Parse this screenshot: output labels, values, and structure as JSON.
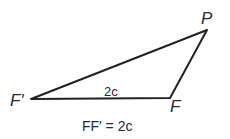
{
  "diagram": {
    "type": "triangle",
    "vertices": [
      {
        "label": "F′",
        "x": 31,
        "y": 99
      },
      {
        "label": "F",
        "x": 170,
        "y": 98
      },
      {
        "label": "P",
        "x": 207,
        "y": 30
      }
    ],
    "edges": [
      {
        "from": "F′",
        "to": "F",
        "label": "2c"
      },
      {
        "from": "F",
        "to": "P",
        "label": ""
      },
      {
        "from": "P",
        "to": "F′",
        "label": ""
      }
    ],
    "side_label": "2c",
    "caption": "FF′ = 2c",
    "stroke_color": "#222222"
  }
}
